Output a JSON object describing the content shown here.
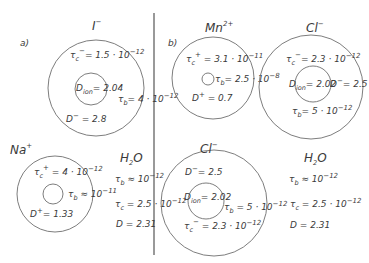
{
  "panels": {
    "a": {
      "label": "a)"
    },
    "b": {
      "label": "b)"
    }
  },
  "ions": [
    {
      "id": "I-",
      "title": "I",
      "charge": "−",
      "tau_c": {
        "sym": "τ",
        "sub": "c",
        "sup": "−",
        "text": "= 1.5 · 10",
        "exp": "−12"
      },
      "D_ion": {
        "sym": "D",
        "sub": "ion",
        "text": "= 2.04"
      },
      "tau_b": {
        "sym": "τ",
        "sub": "b",
        "text": "= 4 · 10",
        "exp": "−12"
      },
      "D": {
        "sym": "D",
        "sup": "−",
        "text": " = 2.8"
      }
    },
    {
      "id": "Mn2+",
      "title": "Mn",
      "charge": "2+",
      "tau_c": {
        "sym": "τ",
        "sub": "c",
        "sup": "+",
        "text": " = 3.1 · 10",
        "exp": "−11"
      },
      "tau_b": {
        "sym": "τ",
        "sub": "b",
        "text": "= 2.5 · 10",
        "exp": "−8"
      },
      "D": {
        "sym": "D",
        "sup": "+",
        "text": " = 0.7"
      }
    },
    {
      "id": "Cl-top",
      "title": "Cl",
      "charge": "−",
      "tau_c": {
        "sym": "τ",
        "sub": "c",
        "sup": "−",
        "text": "= 2.3 · 10",
        "exp": "−12"
      },
      "D_ion": {
        "sym": "D",
        "sub": "ion",
        "text": "= 2.02"
      },
      "D": {
        "sym": "D",
        "sup": "−",
        "text": "= 2.5"
      },
      "tau_b": {
        "sym": "τ",
        "sub": "b",
        "text": "= 5 · 10",
        "exp": "−12"
      }
    },
    {
      "id": "Na+",
      "title": "Na",
      "charge": "+",
      "tau_c": {
        "sym": "τ",
        "sub": "c",
        "sup": "+",
        "text": " = 4 · 10",
        "exp": "−12"
      },
      "tau_b": {
        "sym": "τ",
        "sub": "b",
        "text": " ≈ 10",
        "exp": "−11"
      },
      "D": {
        "sym": "D",
        "sup": "+",
        "text": "= 1.33"
      }
    },
    {
      "id": "Cl-bottom",
      "title": "Cl",
      "charge": "−",
      "D": {
        "sym": "D",
        "sup": "−",
        "text": "= 2.5"
      },
      "D_ion": {
        "sym": "D",
        "sub": "ion",
        "text": "= 2.02"
      },
      "tau_b": {
        "sym": "τ",
        "sub": "b",
        "text": " = 5 · 10",
        "exp": "−12"
      },
      "tau_c": {
        "sym": "τ",
        "sub": "c",
        "sup": "−",
        "text": " = 2.3 · 10",
        "exp": "−12"
      }
    }
  ],
  "water": [
    {
      "id": "H2O-a",
      "title": "H",
      "title_sub": "2",
      "title_end": "O",
      "tau_b": {
        "sym": "τ",
        "sub": "b",
        "text": " ≈ 10",
        "exp": "−12"
      },
      "tau_c": {
        "sym": "τ",
        "sub": "c",
        "text": " = 2.5 · 10",
        "exp": "−12"
      },
      "D": {
        "sym": "D",
        "text": " = 2.31"
      }
    },
    {
      "id": "H2O-b",
      "title": "H",
      "title_sub": "2",
      "title_end": "O",
      "tau_b": {
        "sym": "τ",
        "sub": "b",
        "text": " ≈ 10",
        "exp": "−12"
      },
      "tau_c": {
        "sym": "τ",
        "sub": "c",
        "text": "  = 2.5 · 10",
        "exp": "−12"
      },
      "D": {
        "sym": "D",
        "text": "  = 2.31"
      }
    }
  ]
}
